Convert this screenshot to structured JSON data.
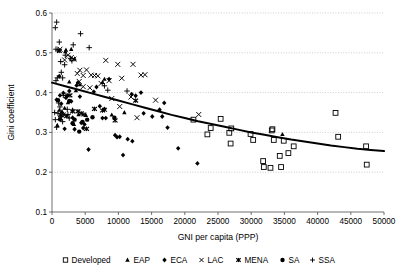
{
  "chart_data": {
    "type": "scatter",
    "title": "",
    "xlabel": "GNI per capita (PPP)",
    "ylabel": "Gini coefficient",
    "xlim": [
      0,
      50000
    ],
    "ylim": [
      0.1,
      0.6
    ],
    "xticks": [
      0,
      5000,
      10000,
      15000,
      20000,
      25000,
      30000,
      35000,
      40000,
      45000,
      50000
    ],
    "xticklabels": [
      "0",
      "5000",
      "10000",
      "15000",
      "20000",
      "25000",
      "30000",
      "35000",
      "40000",
      "45000",
      "50000"
    ],
    "yticks": [
      0.1,
      0.2,
      0.3,
      0.4,
      0.5,
      0.6
    ],
    "yticklabels": [
      "0.1",
      "0.2",
      "0.3",
      "0.4",
      "0.5",
      "0.6"
    ],
    "grid": "horizontal-dotted",
    "legend_position": "bottom",
    "marker_color": "#000000",
    "trendline": {
      "name": "fitted trend",
      "style": "solid-thick-black",
      "points": [
        [
          0,
          0.425
        ],
        [
          2000,
          0.416
        ],
        [
          4000,
          0.407
        ],
        [
          6000,
          0.398
        ],
        [
          8000,
          0.389
        ],
        [
          10000,
          0.38
        ],
        [
          12000,
          0.371
        ],
        [
          14000,
          0.362
        ],
        [
          16000,
          0.353
        ],
        [
          18000,
          0.344
        ],
        [
          20000,
          0.336
        ],
        [
          22000,
          0.328
        ],
        [
          24000,
          0.321
        ],
        [
          26000,
          0.314
        ],
        [
          28000,
          0.307
        ],
        [
          30000,
          0.3
        ],
        [
          32000,
          0.294
        ],
        [
          34000,
          0.288
        ],
        [
          36000,
          0.282
        ],
        [
          38000,
          0.277
        ],
        [
          40000,
          0.272
        ],
        [
          42000,
          0.267
        ],
        [
          44000,
          0.263
        ],
        [
          46000,
          0.259
        ],
        [
          48000,
          0.256
        ],
        [
          50000,
          0.253
        ]
      ]
    },
    "series": [
      {
        "name": "Developed",
        "marker": "open-square",
        "points": [
          [
            21300,
            0.332
          ],
          [
            23400,
            0.295
          ],
          [
            23900,
            0.311
          ],
          [
            25400,
            0.334
          ],
          [
            26700,
            0.299
          ],
          [
            27000,
            0.31
          ],
          [
            26900,
            0.272
          ],
          [
            29900,
            0.296
          ],
          [
            30300,
            0.281
          ],
          [
            31900,
            0.213
          ],
          [
            31800,
            0.228
          ],
          [
            32900,
            0.211
          ],
          [
            33100,
            0.305
          ],
          [
            33200,
            0.308
          ],
          [
            33400,
            0.281
          ],
          [
            34500,
            0.213
          ],
          [
            34300,
            0.241
          ],
          [
            34900,
            0.279
          ],
          [
            35600,
            0.248
          ],
          [
            36400,
            0.265
          ],
          [
            42700,
            0.349
          ],
          [
            43100,
            0.289
          ],
          [
            47300,
            0.265
          ],
          [
            47400,
            0.219
          ]
        ]
      },
      {
        "name": "EAP",
        "marker": "filled-triangle",
        "points": [
          [
            800,
            0.318
          ],
          [
            1100,
            0.356
          ],
          [
            1500,
            0.353
          ],
          [
            1900,
            0.361
          ],
          [
            2000,
            0.503
          ],
          [
            2100,
            0.507
          ],
          [
            2400,
            0.375
          ],
          [
            2600,
            0.427
          ],
          [
            2900,
            0.509
          ],
          [
            3100,
            0.357
          ],
          [
            3300,
            0.32
          ],
          [
            3400,
            0.485
          ],
          [
            3600,
            0.405
          ],
          [
            4000,
            0.345
          ],
          [
            4200,
            0.42
          ],
          [
            5100,
            0.343
          ],
          [
            7600,
            0.426
          ],
          [
            7900,
            0.434
          ],
          [
            9000,
            0.344
          ],
          [
            10900,
            0.35
          ],
          [
            34700,
            0.295
          ]
        ]
      },
      {
        "name": "ECA",
        "marker": "filled-diamond",
        "points": [
          [
            700,
            0.382
          ],
          [
            1100,
            0.441
          ],
          [
            1200,
            0.393
          ],
          [
            1400,
            0.372
          ],
          [
            1700,
            0.399
          ],
          [
            1900,
            0.309
          ],
          [
            2100,
            0.387
          ],
          [
            2300,
            0.392
          ],
          [
            2600,
            0.404
          ],
          [
            2900,
            0.378
          ],
          [
            3100,
            0.337
          ],
          [
            3400,
            0.308
          ],
          [
            3700,
            0.418
          ],
          [
            3900,
            0.425
          ],
          [
            4200,
            0.39
          ],
          [
            4400,
            0.324
          ],
          [
            4700,
            0.311
          ],
          [
            4900,
            0.32
          ],
          [
            5500,
            0.257
          ],
          [
            6300,
            0.402
          ],
          [
            6700,
            0.414
          ],
          [
            7200,
            0.366
          ],
          [
            7600,
            0.336
          ],
          [
            7900,
            0.359
          ],
          [
            8100,
            0.336
          ],
          [
            8600,
            0.434
          ],
          [
            9500,
            0.293
          ],
          [
            9800,
            0.288
          ],
          [
            10200,
            0.289
          ],
          [
            10700,
            0.243
          ],
          [
            11400,
            0.283
          ],
          [
            12100,
            0.278
          ],
          [
            12000,
            0.396
          ],
          [
            12600,
            0.392
          ],
          [
            13400,
            0.4
          ],
          [
            13800,
            0.348
          ],
          [
            15100,
            0.34
          ],
          [
            16200,
            0.357
          ],
          [
            16600,
            0.34
          ],
          [
            16900,
            0.374
          ],
          [
            17400,
            0.312
          ],
          [
            19000,
            0.26
          ],
          [
            21900,
            0.222
          ]
        ]
      },
      {
        "name": "LAC",
        "marker": "cross-x",
        "points": [
          [
            1200,
            0.509
          ],
          [
            1900,
            0.482
          ],
          [
            2400,
            0.494
          ],
          [
            2900,
            0.488
          ],
          [
            3300,
            0.484
          ],
          [
            3800,
            0.448
          ],
          [
            4200,
            0.456
          ],
          [
            4700,
            0.443
          ],
          [
            5200,
            0.457
          ],
          [
            5900,
            0.444
          ],
          [
            6400,
            0.443
          ],
          [
            6900,
            0.442
          ],
          [
            8100,
            0.481
          ],
          [
            8600,
            0.43
          ],
          [
            9900,
            0.471
          ],
          [
            10500,
            0.436
          ],
          [
            12200,
            0.471
          ],
          [
            13400,
            0.444
          ],
          [
            14000,
            0.445
          ],
          [
            4100,
            0.428
          ],
          [
            4700,
            0.415
          ],
          [
            5700,
            0.412
          ],
          [
            7400,
            0.423
          ],
          [
            9000,
            0.385
          ],
          [
            10200,
            0.365
          ],
          [
            11900,
            0.389
          ],
          [
            12800,
            0.337
          ],
          [
            15600,
            0.381
          ],
          [
            22100,
            0.345
          ]
        ]
      },
      {
        "name": "MENA",
        "marker": "star-asterisk",
        "points": [
          [
            1100,
            0.505
          ],
          [
            1300,
            0.344
          ],
          [
            1700,
            0.345
          ],
          [
            2200,
            0.341
          ],
          [
            2700,
            0.393
          ],
          [
            3100,
            0.353
          ],
          [
            3900,
            0.353
          ],
          [
            4400,
            0.348
          ],
          [
            4800,
            0.345
          ],
          [
            5200,
            0.309
          ],
          [
            6400,
            0.359
          ],
          [
            7600,
            0.355
          ],
          [
            7900,
            0.357
          ],
          [
            9500,
            0.33
          ],
          [
            12600,
            0.38
          ]
        ]
      },
      {
        "name": "SA",
        "marker": "filled-circle",
        "points": [
          [
            900,
            0.381
          ],
          [
            1200,
            0.333
          ],
          [
            2600,
            0.379
          ],
          [
            3100,
            0.323
          ],
          [
            3400,
            0.332
          ],
          [
            4100,
            0.302
          ],
          [
            4600,
            0.326
          ],
          [
            5300,
            0.332
          ],
          [
            6100,
            0.338
          ],
          [
            9400,
            0.337
          ]
        ]
      },
      {
        "name": "SSA",
        "marker": "plus",
        "points": [
          [
            500,
            0.563
          ],
          [
            700,
            0.577
          ],
          [
            600,
            0.509
          ],
          [
            900,
            0.507
          ],
          [
            1100,
            0.527
          ],
          [
            1300,
            0.478
          ],
          [
            1400,
            0.451
          ],
          [
            1600,
            0.437
          ],
          [
            1700,
            0.393
          ],
          [
            1900,
            0.47
          ],
          [
            2000,
            0.494
          ],
          [
            2100,
            0.393
          ],
          [
            2300,
            0.358
          ],
          [
            2400,
            0.345
          ],
          [
            2600,
            0.336
          ],
          [
            2800,
            0.486
          ],
          [
            3000,
            0.48
          ],
          [
            3200,
            0.52
          ],
          [
            600,
            0.43
          ],
          [
            800,
            0.437
          ],
          [
            400,
            0.35
          ],
          [
            500,
            0.332
          ],
          [
            700,
            0.313
          ],
          [
            900,
            0.348
          ],
          [
            1000,
            0.374
          ],
          [
            1200,
            0.364
          ],
          [
            1400,
            0.339
          ],
          [
            1600,
            0.327
          ],
          [
            4300,
            0.548
          ],
          [
            5600,
            0.513
          ],
          [
            7900,
            0.417
          ],
          [
            8400,
            0.406
          ],
          [
            11300,
            0.404
          ]
        ]
      }
    ]
  },
  "legend": {
    "items": [
      {
        "label": "Developed",
        "marker": "open-square"
      },
      {
        "label": "EAP",
        "marker": "filled-triangle"
      },
      {
        "label": "ECA",
        "marker": "filled-diamond"
      },
      {
        "label": "LAC",
        "marker": "cross-x"
      },
      {
        "label": "MENA",
        "marker": "star-asterisk"
      },
      {
        "label": "SA",
        "marker": "filled-circle"
      },
      {
        "label": "SSA",
        "marker": "plus"
      }
    ]
  }
}
